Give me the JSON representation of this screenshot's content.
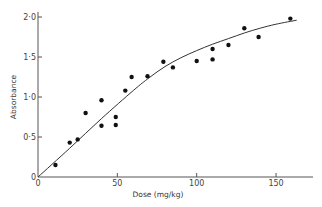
{
  "chart_data": {
    "type": "scatter",
    "title": "",
    "xlabel": "Dose (mg/kg)",
    "ylabel": "Absorbance",
    "xlim": [
      0,
      170
    ],
    "ylim": [
      0,
      2.0
    ],
    "grid": false,
    "legend": null,
    "x_ticks": [
      0,
      50,
      100,
      150
    ],
    "x_tick_labels": [
      "0",
      "50",
      "100",
      "150"
    ],
    "y_ticks": [
      0,
      0.5,
      1.0,
      1.5,
      2.0
    ],
    "y_tick_labels": [
      "0",
      "0·5",
      "1·0",
      "1·5",
      "2·0"
    ],
    "series": [
      {
        "name": "observations",
        "kind": "scatter",
        "points": [
          [
            11,
            0.15
          ],
          [
            20,
            0.43
          ],
          [
            25,
            0.47
          ],
          [
            30,
            0.8
          ],
          [
            40,
            0.96
          ],
          [
            40,
            0.64
          ],
          [
            49,
            0.75
          ],
          [
            49,
            0.65
          ],
          [
            55,
            1.08
          ],
          [
            59,
            1.25
          ],
          [
            69,
            1.26
          ],
          [
            79,
            1.44
          ],
          [
            85,
            1.37
          ],
          [
            100,
            1.45
          ],
          [
            110,
            1.6
          ],
          [
            110,
            1.47
          ],
          [
            120,
            1.65
          ],
          [
            130,
            1.86
          ],
          [
            139,
            1.75
          ],
          [
            159,
            1.98
          ]
        ]
      },
      {
        "name": "fitted curve",
        "kind": "line",
        "points": [
          [
            0,
            0
          ],
          [
            20,
            0.36
          ],
          [
            40,
            0.73
          ],
          [
            60,
            1.08
          ],
          [
            70,
            1.24
          ],
          [
            80,
            1.38
          ],
          [
            90,
            1.49
          ],
          [
            100,
            1.58
          ],
          [
            110,
            1.66
          ],
          [
            120,
            1.73
          ],
          [
            130,
            1.8
          ],
          [
            140,
            1.86
          ],
          [
            150,
            1.91
          ],
          [
            163,
            1.96
          ]
        ]
      }
    ]
  },
  "colors": {
    "axis": "#555555",
    "points": "#111111",
    "curve": "#333333"
  }
}
